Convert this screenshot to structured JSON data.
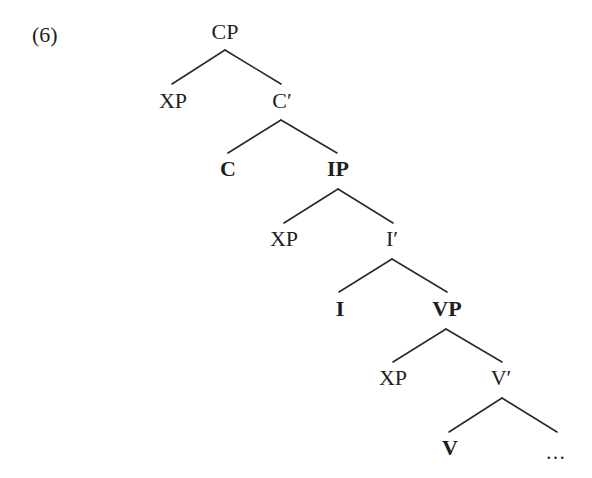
{
  "example_number": "(6)",
  "tree": {
    "type": "X-bar syntax tree",
    "nodes": {
      "cp": {
        "label": "CP",
        "bold": false
      },
      "cp_spec": {
        "label": "XP",
        "bold": false
      },
      "c_bar": {
        "label": "C′",
        "bold": false
      },
      "c_head": {
        "label": "C",
        "bold": true
      },
      "ip": {
        "label": "IP",
        "bold": true
      },
      "ip_spec": {
        "label": "XP",
        "bold": false
      },
      "i_bar": {
        "label": "I′",
        "bold": false
      },
      "i_head": {
        "label": "I",
        "bold": true
      },
      "vp": {
        "label": "VP",
        "bold": true
      },
      "vp_spec": {
        "label": "XP",
        "bold": false
      },
      "v_bar": {
        "label": "V′",
        "bold": false
      },
      "v_head": {
        "label": "V",
        "bold": true
      },
      "v_complement": {
        "label": "…",
        "bold": false
      }
    },
    "edges": [
      [
        "CP",
        "XP"
      ],
      [
        "CP",
        "C′"
      ],
      [
        "C′",
        "C"
      ],
      [
        "C′",
        "IP"
      ],
      [
        "IP",
        "XP"
      ],
      [
        "IP",
        "I′"
      ],
      [
        "I′",
        "I"
      ],
      [
        "I′",
        "VP"
      ],
      [
        "VP",
        "XP"
      ],
      [
        "VP",
        "V′"
      ],
      [
        "V′",
        "V"
      ],
      [
        "V′",
        "…"
      ]
    ]
  }
}
